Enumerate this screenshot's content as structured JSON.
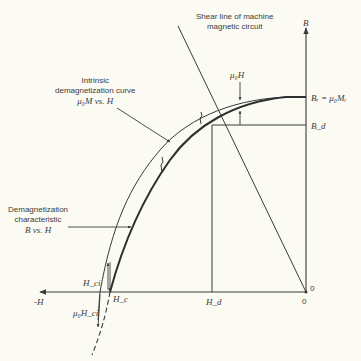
{
  "diagram": {
    "labels": {
      "shear_line": [
        "Shear line of machine",
        "magnetic circuit"
      ],
      "intrinsic": [
        "Intrinsic",
        "demagnetization curve",
        "μ₀M vs. H"
      ],
      "demag": [
        "Demagnetization",
        "characteristic",
        "B vs. H"
      ],
      "mu0H": "μ₀H",
      "B_axis": "B",
      "Br": "Bᵣ = μ₀Mᵣ",
      "Bd": "B_d",
      "neg_H": "-H",
      "Hd": "H_d",
      "Hc": "H_c",
      "Hci": "H_ci",
      "mu0Hci": "μ₀H_ci",
      "origin_right": "0",
      "origin_below": "0"
    },
    "colors": {
      "background": "#fbfbf4",
      "line": "#3a3a3a"
    },
    "points": {
      "origin": [
        306,
        292
      ],
      "Hd_x": 212,
      "Bd_y": 125,
      "Br_y": 97,
      "Hc_x": 110,
      "Hci_x": 100
    }
  }
}
